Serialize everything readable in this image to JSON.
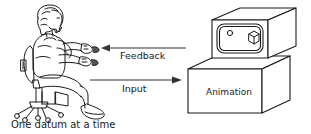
{
  "diagram": {
    "background_color": "#ffffff",
    "stroke_color": "#1a1a1a",
    "caption": "One datum at a time",
    "arrows": [
      {
        "name": "feedback-arrow",
        "label": "Feedback",
        "direction": "left",
        "from": "display",
        "to": "person"
      },
      {
        "name": "input-arrow",
        "label": "Input",
        "direction": "right",
        "from": "person",
        "to": "display"
      }
    ],
    "actor": {
      "name": "seated-person",
      "description": "Person seated on an office chair holding an input device"
    },
    "machine": {
      "name": "animation-workstation",
      "base_label": "Animation",
      "screen_contents": [
        "circle-shape",
        "cube-shape"
      ]
    }
  }
}
